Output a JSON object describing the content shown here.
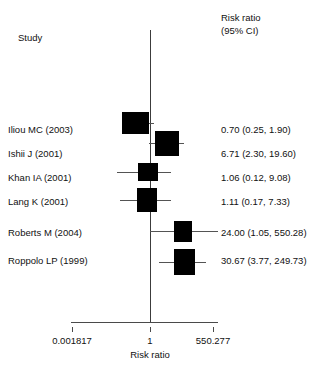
{
  "header": {
    "study_column": "Study",
    "effect_column_line1": "Risk ratio",
    "effect_column_line2": "(95% CI)"
  },
  "axis": {
    "title": "Risk ratio",
    "tick_labels": [
      "0.001817",
      "1",
      "550.277"
    ],
    "tick_values": [
      0.001817,
      1,
      550.277
    ],
    "reference_line_value": 1
  },
  "chart_data": {
    "type": "forest",
    "title": "",
    "xlabel": "Risk ratio",
    "ylabel": "",
    "effect_measure": "Risk ratio",
    "ci_level": "95% CI",
    "xscale": "log",
    "xlim": [
      0.001817,
      550.277
    ],
    "null_line": 1,
    "grid": false,
    "legend": "none",
    "studies": [
      {
        "label": "Iliou MC (2003)",
        "estimate": 0.7,
        "ci_low": 0.25,
        "ci_high": 1.9,
        "display": "0.70 (0.25, 1.90)"
      },
      {
        "label": "Ishii J (2001)",
        "estimate": 6.71,
        "ci_low": 2.3,
        "ci_high": 19.6,
        "display": "6.71 (2.30, 19.60)"
      },
      {
        "label": "Khan IA (2001)",
        "estimate": 1.06,
        "ci_low": 0.12,
        "ci_high": 9.08,
        "display": "1.06 (0.12, 9.08)"
      },
      {
        "label": "Lang K (2001)",
        "estimate": 1.11,
        "ci_low": 0.17,
        "ci_high": 7.33,
        "display": "1.11 (0.17, 7.33)"
      },
      {
        "label": "Roberts M (2004)",
        "estimate": 24.0,
        "ci_low": 1.05,
        "ci_high": 550.28,
        "display": "24.00 (1.05, 550.28)"
      },
      {
        "label": "Roppolo LP (1999)",
        "estimate": 30.67,
        "ci_low": 3.77,
        "ci_high": 249.73,
        "display": "30.67 (3.77, 249.73)"
      }
    ]
  },
  "geometry": {
    "rows": [
      {
        "label_top": 124,
        "box_x": 122,
        "box_y": 112,
        "box_w": 27,
        "box_h": 22,
        "wh_x": 122,
        "wh_w": 32,
        "wh_y": 123
      },
      {
        "label_top": 148,
        "box_x": 155,
        "box_y": 131,
        "box_w": 24,
        "box_h": 25,
        "wh_x": 149,
        "wh_w": 35,
        "wh_y": 143
      },
      {
        "label_top": 172,
        "box_x": 138,
        "box_y": 163,
        "box_w": 20,
        "box_h": 18,
        "wh_x": 117,
        "wh_w": 54,
        "wh_y": 172
      },
      {
        "label_top": 196,
        "box_x": 137,
        "box_y": 188,
        "box_w": 20,
        "box_h": 24,
        "wh_x": 120,
        "wh_w": 51,
        "wh_y": 200
      },
      {
        "label_top": 227,
        "box_x": 174,
        "box_y": 221,
        "box_w": 18,
        "box_h": 21,
        "wh_x": 150,
        "wh_w": 68,
        "wh_y": 231
      },
      {
        "label_top": 255,
        "box_x": 174,
        "box_y": 249,
        "box_w": 21,
        "box_h": 26,
        "wh_x": 159,
        "wh_w": 47,
        "wh_y": 262
      }
    ],
    "tick_x": [
      72,
      150,
      213
    ]
  }
}
